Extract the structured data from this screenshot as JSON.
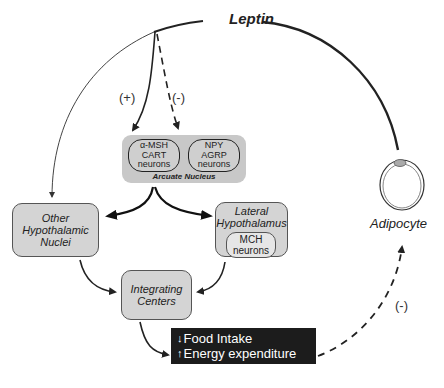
{
  "title": "Leptin",
  "signals": {
    "stimulatory": "(+)",
    "inhibitory": "(-)",
    "feedback": "(-)"
  },
  "arcuate_nucleus": {
    "label": "Arcuate Nucleus",
    "neuron_groups": [
      {
        "lines": [
          "α-MSH",
          "CART",
          "neurons"
        ]
      },
      {
        "lines": [
          "NPY",
          "AGRP",
          "neurons"
        ]
      }
    ]
  },
  "other_hypothalamic": {
    "lines": [
      "Other",
      "Hypothalamic",
      "Nuclei"
    ]
  },
  "lateral_hypothalamus": {
    "lines": [
      "Lateral",
      "Hypothalamus"
    ],
    "inner": {
      "lines": [
        "MCH",
        "neurons"
      ]
    }
  },
  "integrating_centers": {
    "lines": [
      "Integrating",
      "Centers"
    ]
  },
  "outcome": {
    "rows": [
      {
        "arrow": "↓",
        "text": "Food Intake"
      },
      {
        "arrow": "↑",
        "text": "Energy expenditure"
      }
    ]
  },
  "adipocyte": {
    "label": "Adipocyte"
  },
  "colors": {
    "box_fill": "#d4d4d4",
    "arcuate_fill": "#c8c8c8",
    "outcome_fill": "#1c1c1c",
    "line": "#222222"
  }
}
